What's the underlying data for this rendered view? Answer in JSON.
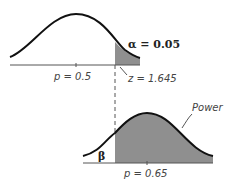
{
  "diagram": {
    "type": "hypothesis-test-power-illustration",
    "top_distribution": {
      "mean_label": "p = 0.5",
      "alpha_label": "α = 0.05",
      "critical_label": "z = 1.645"
    },
    "bottom_distribution": {
      "mean_label": "p = 0.65",
      "beta_label": "β",
      "power_label": "Power"
    },
    "colors": {
      "curve": "#111111",
      "shade": "#8f8f8f",
      "axis": "#555555",
      "dashed": "#555555"
    }
  }
}
